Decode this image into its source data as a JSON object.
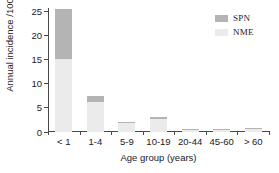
{
  "chart_data": {
    "type": "bar",
    "subtype": "stacked-vertical",
    "title": "",
    "xlabel": "Age group (years)",
    "ylabel": "Annual incidence /100 000",
    "categories": [
      "< 1",
      "1-4",
      "5-9",
      "10-19",
      "20-44",
      "45-60",
      "> 60"
    ],
    "series": [
      {
        "name": "NME",
        "color": "#ebebeb",
        "values": [
          15.2,
          6.3,
          1.9,
          2.8,
          0.4,
          0.4,
          0.6
        ]
      },
      {
        "name": "SPN",
        "color": "#b4b4b4",
        "values": [
          10.3,
          1.1,
          0.2,
          0.3,
          0.15,
          0.2,
          0.25
        ]
      }
    ],
    "totals": [
      25.5,
      7.4,
      2.1,
      3.1,
      0.55,
      0.6,
      0.85
    ],
    "ylim": [
      0,
      25.8
    ],
    "yticks": [
      0,
      5,
      10,
      15,
      20,
      25
    ],
    "ytick_labels": [
      "0",
      "5",
      "10",
      "15",
      "20",
      "25"
    ],
    "grid": false,
    "legend_position": "top-right",
    "legend_entries": [
      {
        "label": "SPN",
        "color": "#b4b4b4"
      },
      {
        "label": "NME",
        "color": "#ebebeb"
      }
    ]
  }
}
